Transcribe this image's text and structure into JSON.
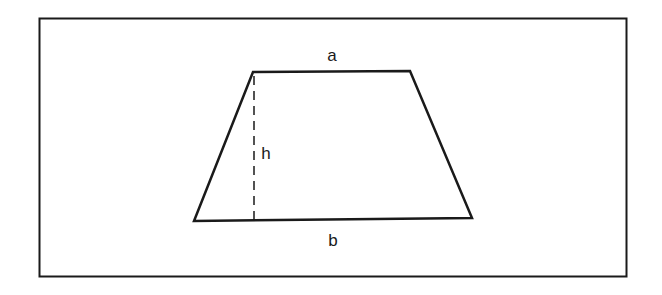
{
  "diagram": {
    "labels": {
      "top_side": "a",
      "bottom_side": "b",
      "height": "h"
    },
    "colors": {
      "stroke": "#1a1a1a",
      "background": "#ffffff"
    }
  }
}
